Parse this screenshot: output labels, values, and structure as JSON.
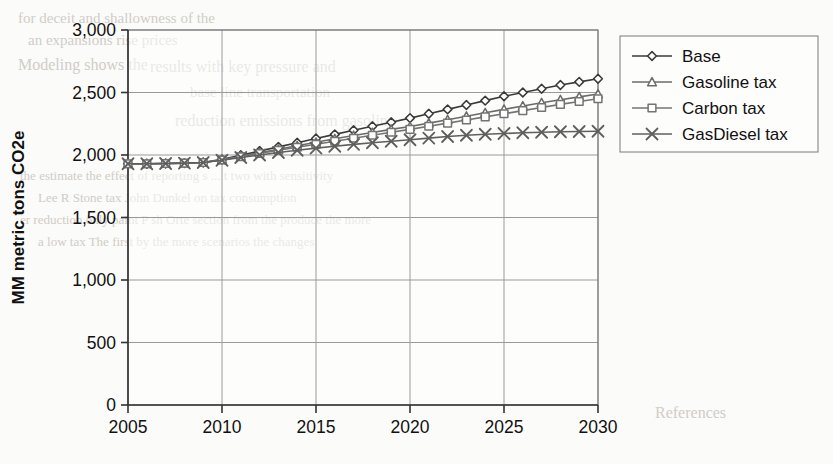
{
  "chart_data": {
    "type": "line",
    "title": "",
    "xlabel": "",
    "ylabel": "MM metric tons CO2e",
    "xlim": [
      2005,
      2030
    ],
    "ylim": [
      0,
      3000
    ],
    "ytick_labels": [
      "3,000",
      "2,500",
      "2,000",
      "1,500",
      "1,000",
      "500",
      "0"
    ],
    "ytick_values": [
      3000,
      2500,
      2000,
      1500,
      1000,
      500,
      0
    ],
    "xtick_labels": [
      "2005",
      "2010",
      "2015",
      "2020",
      "2025",
      "2030"
    ],
    "xtick_values": [
      2005,
      2010,
      2015,
      2020,
      2025,
      2030
    ],
    "grid": true,
    "legend_position": "right",
    "x": [
      2005,
      2006,
      2007,
      2008,
      2009,
      2010,
      2011,
      2012,
      2013,
      2014,
      2015,
      2016,
      2017,
      2018,
      2019,
      2020,
      2021,
      2022,
      2023,
      2024,
      2025,
      2026,
      2027,
      2028,
      2029,
      2030
    ],
    "series": [
      {
        "name": "Base",
        "marker": "diamond",
        "color": "#3a3a3a",
        "values": [
          1930,
          1930,
          1932,
          1935,
          1940,
          1965,
          1998,
          2032,
          2065,
          2098,
          2132,
          2165,
          2198,
          2230,
          2262,
          2295,
          2330,
          2365,
          2400,
          2435,
          2470,
          2500,
          2530,
          2560,
          2585,
          2610
        ]
      },
      {
        "name": "Gasoline tax",
        "marker": "triangle",
        "color": "#6b6b6b",
        "values": [
          1930,
          1930,
          1932,
          1935,
          1940,
          1962,
          1990,
          2018,
          2046,
          2074,
          2102,
          2130,
          2156,
          2180,
          2205,
          2228,
          2255,
          2282,
          2310,
          2338,
          2365,
          2392,
          2418,
          2442,
          2465,
          2488
        ]
      },
      {
        "name": "Carbon tax",
        "marker": "square",
        "color": "#747474",
        "values": [
          1930,
          1930,
          1932,
          1935,
          1940,
          1960,
          1986,
          2012,
          2038,
          2062,
          2086,
          2110,
          2134,
          2158,
          2182,
          2205,
          2230,
          2255,
          2280,
          2305,
          2330,
          2355,
          2380,
          2405,
          2428,
          2450
        ]
      },
      {
        "name": "GasDiesel tax",
        "marker": "x",
        "color": "#5f5f5f",
        "values": [
          1930,
          1930,
          1932,
          1935,
          1940,
          1958,
          1980,
          2000,
          2020,
          2038,
          2055,
          2070,
          2085,
          2098,
          2110,
          2122,
          2135,
          2148,
          2158,
          2166,
          2172,
          2178,
          2182,
          2186,
          2188,
          2190
        ]
      }
    ]
  },
  "legend": {
    "items": [
      {
        "label": "Base"
      },
      {
        "label": "Gasoline tax"
      },
      {
        "label": "Carbon tax"
      },
      {
        "label": "GasDiesel tax"
      }
    ]
  },
  "background_text": {
    "lines": [
      {
        "text": "for   deceit and shallowness of the",
        "x": 18,
        "y": 10,
        "size": 15
      },
      {
        "text": "an expansions rise prices",
        "x": 28,
        "y": 32,
        "size": 15
      },
      {
        "text": "Modeling  shows  the",
        "x": 18,
        "y": 56,
        "size": 16
      },
      {
        "text": "results with key pressure and",
        "x": 150,
        "y": 58,
        "size": 16
      },
      {
        "text": "base  line          transportation",
        "x": 190,
        "y": 84,
        "size": 15
      },
      {
        "text": "reduction emissions from   gasoline",
        "x": 175,
        "y": 112,
        "size": 16
      },
      {
        "text": "the estimate the effect of reporting  s ...  t  two with  sensitivity",
        "x": 20,
        "y": 168,
        "size": 13
      },
      {
        "text": "Lee R Stone  tax         John Dunkel  on  tax  consumption",
        "x": 38,
        "y": 190,
        "size": 13
      },
      {
        "text": "er  reduction only  paint    P  sh Orte  section   from  the  produce  the more",
        "x": 20,
        "y": 212,
        "size": 13
      },
      {
        "text": "a  low tax  The first by the   more scenarios   the  changes",
        "x": 38,
        "y": 234,
        "size": 13
      },
      {
        "text": "References",
        "x": 655,
        "y": 404,
        "size": 16
      }
    ]
  }
}
